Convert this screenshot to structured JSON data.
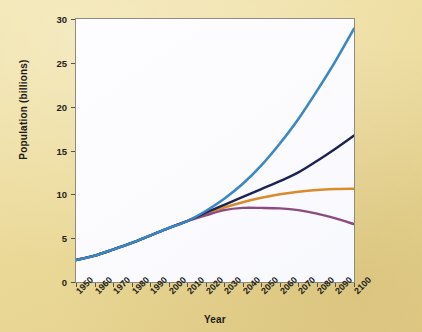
{
  "figure": {
    "background_color": "#ecdb9b",
    "plot_background_color": "#fbfbfe",
    "plot_border_color": "#8d8b84"
  },
  "chart_data": {
    "type": "line",
    "title": "",
    "subtitle": "",
    "xlabel": "Year",
    "ylabel": "Population (billions)",
    "xlim": [
      1950,
      2100
    ],
    "ylim": [
      0,
      30
    ],
    "grid": false,
    "legend": "none",
    "x_tick_labels": [
      "1950",
      "1960",
      "1970",
      "1980",
      "1990",
      "2000",
      "2010",
      "2020",
      "2030",
      "2040",
      "2050",
      "2060",
      "2070",
      "2080",
      "2090",
      "2100"
    ],
    "y_tick_labels": [
      "0",
      "5",
      "10",
      "15",
      "20",
      "25",
      "30"
    ],
    "x_tick_values": [
      1950,
      1960,
      1970,
      1980,
      1990,
      2000,
      2010,
      2020,
      2030,
      2040,
      2050,
      2060,
      2070,
      2080,
      2090,
      2100
    ],
    "y_tick_values": [
      0,
      5,
      10,
      15,
      20,
      25,
      30
    ],
    "x": [
      1950,
      1960,
      1970,
      1980,
      1990,
      2000,
      2010,
      2020,
      2030,
      2040,
      2050,
      2060,
      2070,
      2080,
      2090,
      2100
    ],
    "series": [
      {
        "name": "high-variant",
        "color": "#3b87c4",
        "width": 2.6,
        "values": [
          2.5,
          3.0,
          3.7,
          4.45,
          5.3,
          6.15,
          6.95,
          8.1,
          9.5,
          11.2,
          13.3,
          15.8,
          18.6,
          21.8,
          25.2,
          28.9
        ]
      },
      {
        "name": "medium-variant",
        "color": "#1b2352",
        "width": 2.4,
        "values": [
          2.5,
          3.0,
          3.7,
          4.45,
          5.3,
          6.15,
          6.95,
          7.9,
          8.8,
          9.7,
          10.6,
          11.5,
          12.5,
          13.8,
          15.2,
          16.7
        ]
      },
      {
        "name": "constant-fertility-low",
        "color": "#d88c2a",
        "width": 2.5,
        "values": [
          2.5,
          3.0,
          3.7,
          4.45,
          5.3,
          6.15,
          6.95,
          7.8,
          8.5,
          9.1,
          9.6,
          10.0,
          10.3,
          10.5,
          10.6,
          10.65
        ]
      },
      {
        "name": "low-variant",
        "color": "#8b4a82",
        "width": 2.4,
        "values": [
          2.5,
          3.0,
          3.7,
          4.45,
          5.3,
          6.15,
          6.95,
          7.6,
          8.2,
          8.45,
          8.45,
          8.4,
          8.2,
          7.8,
          7.25,
          6.6
        ]
      }
    ]
  }
}
